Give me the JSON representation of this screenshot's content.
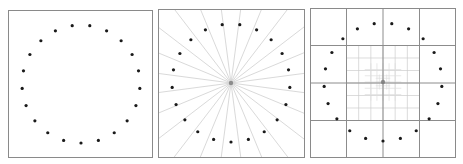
{
  "figure": {
    "panel_count": 3,
    "colors": {
      "background": "#ffffff",
      "frame": "#8a8a8a",
      "dot": "#1a1a1a",
      "spoke": "#cfcfcf",
      "grid_major": "#8c8c8c",
      "grid_minor": "#cdcdcd",
      "grid_fine": "#dedede",
      "center": "#7a7a7a"
    },
    "panels": [
      {
        "name": "points-only",
        "frame": {
          "x": 8,
          "y": 10,
          "w": 145,
          "h": 148
        },
        "center": {
          "x": 81,
          "y": 84
        },
        "radius": 59
      },
      {
        "name": "radial-spokes",
        "frame": {
          "x": 158,
          "y": 9,
          "w": 147,
          "h": 149
        },
        "center": {
          "x": 231,
          "y": 83
        },
        "radius": 59,
        "spoke_count": 24
      },
      {
        "name": "quadtree-grid",
        "frame": {
          "x": 310,
          "y": 8,
          "w": 146,
          "h": 150
        },
        "center": {
          "x": 383,
          "y": 82
        },
        "radius": 59,
        "major_divisions": 4
      }
    ],
    "point_count": 21
  }
}
